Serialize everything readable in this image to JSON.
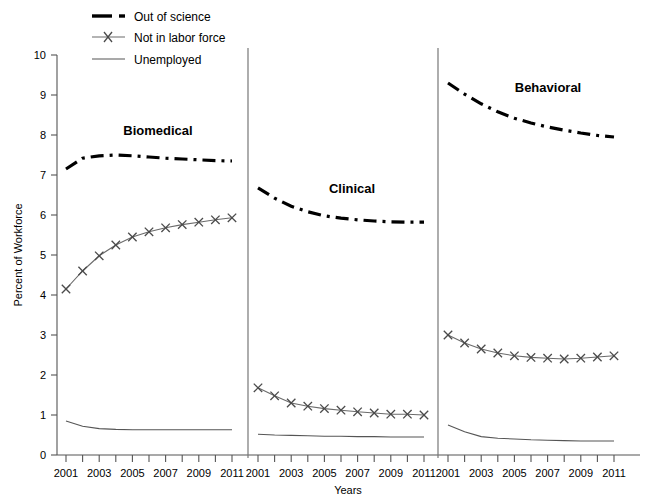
{
  "chart_data": {
    "type": "line",
    "title": "",
    "xlabel": "Years",
    "ylabel": "Percent of Workforce",
    "ylim": [
      0,
      10
    ],
    "ytick_labels": [
      "0",
      "1",
      "2",
      "3",
      "4",
      "5",
      "6",
      "7",
      "8",
      "9",
      "10"
    ],
    "grid": false,
    "legend_position": "top-left",
    "x": [
      2001,
      2002,
      2003,
      2004,
      2005,
      2006,
      2007,
      2008,
      2009,
      2010,
      2011
    ],
    "xtick_labels": [
      "2001",
      "2002",
      "2003",
      "2004",
      "2005",
      "2006",
      "2007",
      "2008",
      "2009",
      "2010",
      "2011"
    ],
    "xtick_labels_shown": [
      "2001",
      "2003",
      "2005",
      "2007",
      "2009",
      "2011"
    ],
    "legend": [
      {
        "key": "out_of_science",
        "label": "Out of science",
        "style": "thick-dash-dot",
        "color": "#000000"
      },
      {
        "key": "not_in_labor_force",
        "label": "Not in labor force",
        "style": "thin-line-x-marker",
        "color": "#6b6b6b"
      },
      {
        "key": "unemployed",
        "label": "Unemployed",
        "style": "thin-line",
        "color": "#555555"
      }
    ],
    "panels": [
      {
        "key": "biomedical",
        "title": "Biomedical",
        "series": [
          {
            "name": "Out of science",
            "values": [
              7.15,
              7.42,
              7.48,
              7.5,
              7.48,
              7.45,
              7.42,
              7.4,
              7.38,
              7.36,
              7.35
            ]
          },
          {
            "name": "Not in labor force",
            "values": [
              4.15,
              4.6,
              4.98,
              5.25,
              5.45,
              5.58,
              5.68,
              5.76,
              5.82,
              5.88,
              5.93
            ]
          },
          {
            "name": "Unemployed",
            "values": [
              0.85,
              0.72,
              0.66,
              0.64,
              0.63,
              0.63,
              0.63,
              0.63,
              0.63,
              0.63,
              0.63
            ]
          }
        ]
      },
      {
        "key": "clinical",
        "title": "Clinical",
        "series": [
          {
            "name": "Out of science",
            "values": [
              6.68,
              6.42,
              6.22,
              6.08,
              5.98,
              5.92,
              5.88,
              5.85,
              5.83,
              5.82,
              5.82
            ]
          },
          {
            "name": "Not in labor force",
            "values": [
              1.68,
              1.48,
              1.3,
              1.22,
              1.16,
              1.12,
              1.08,
              1.05,
              1.02,
              1.02,
              1.0
            ]
          },
          {
            "name": "Unemployed",
            "values": [
              0.52,
              0.5,
              0.49,
              0.48,
              0.47,
              0.47,
              0.46,
              0.46,
              0.45,
              0.45,
              0.45
            ]
          }
        ]
      },
      {
        "key": "behavioral",
        "title": "Behavioral",
        "series": [
          {
            "name": "Out of science",
            "values": [
              9.3,
              9.02,
              8.78,
              8.58,
              8.42,
              8.3,
              8.2,
              8.12,
              8.05,
              7.99,
              7.95
            ]
          },
          {
            "name": "Not in labor force",
            "values": [
              3.0,
              2.8,
              2.65,
              2.55,
              2.48,
              2.44,
              2.42,
              2.4,
              2.42,
              2.45,
              2.48
            ]
          },
          {
            "name": "Unemployed",
            "values": [
              0.75,
              0.58,
              0.46,
              0.42,
              0.4,
              0.38,
              0.37,
              0.36,
              0.35,
              0.35,
              0.35
            ]
          }
        ]
      }
    ]
  },
  "axes": {
    "y_title": "Percent of Workforce",
    "x_title": "Years"
  }
}
